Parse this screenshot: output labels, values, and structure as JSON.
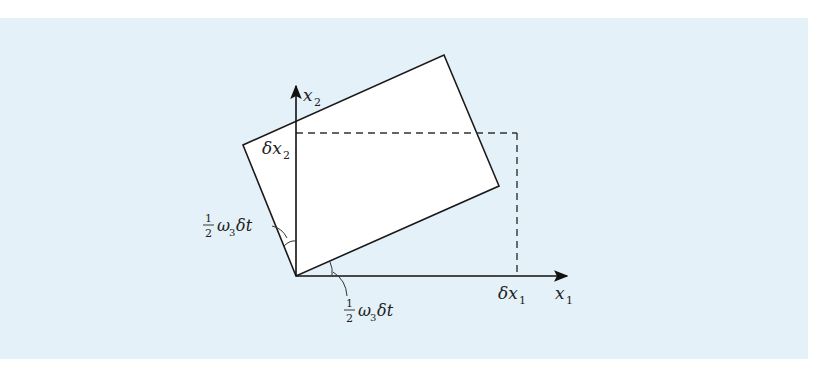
{
  "figure": {
    "background_color": "#e4f1f8",
    "axes": {
      "x_label": {
        "main": "x",
        "sub": "1"
      },
      "y_label": {
        "main": "x",
        "sub": "2"
      }
    },
    "labels": {
      "delta_x1": {
        "main": "δx",
        "sub": "1"
      },
      "delta_x2": {
        "main": "δx",
        "sub": "2"
      },
      "angle_upper": {
        "num": "1",
        "den": "2",
        "omega": "ω",
        "omega_sub": "3",
        "rest": "δt"
      },
      "angle_lower": {
        "num": "1",
        "den": "2",
        "omega": "ω",
        "omega_sub": "3",
        "rest": "δt"
      }
    },
    "shapes": {
      "original_element": "dashed rectangle from origin to (δx1, δx2)",
      "rotated_element": "solid rectangle rotated by ½ω₃δt"
    }
  }
}
